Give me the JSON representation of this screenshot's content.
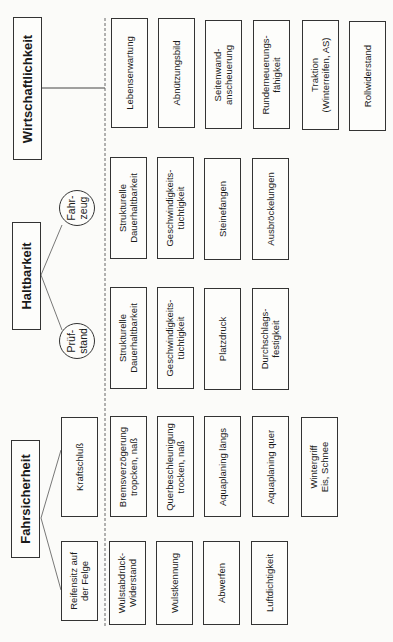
{
  "categories": {
    "wirtschaftlichkeit": {
      "title": "Wirtschaftlichkeit",
      "items": [
        "Lebenserwartung",
        "Abnützungsbild",
        "Seitenwand-\nanscheuerung",
        "Runderneuerungs-\nfähigkeit",
        "Traktion\n(Winterreifen, AS)",
        "Rollwiderstand"
      ]
    },
    "haltbarkeit": {
      "title": "Haltbarkeit",
      "branches": [
        {
          "label": "Fahr-\nzeug",
          "items": [
            "Strukturelle\nDauerhaltbarkeit",
            "Geschwindigkeits-\ntüchtigkeit",
            "Steinefangen",
            "Ausbröckelungen"
          ]
        },
        {
          "label": "Prüf-\nstand",
          "items": [
            "Strukturelle\nDauerhaltbarkeit",
            "Geschwindigkeits-\ntüchtigkeit",
            "Platzdruck",
            "Durchschlags-\nfestigkeit"
          ]
        }
      ]
    },
    "fahrsicherheit": {
      "title": "Fahrsicherheit",
      "branches": [
        {
          "label": "Kraftschluß",
          "items": [
            "Bremsverzögerung\ntropcken, naß",
            "Querbeschleunigung\ntrocken, naß",
            "Aquaplaning längs",
            "Aquaplaning quer",
            "Wintergriff\nEis, Schnee"
          ]
        },
        {
          "label": "Reifensitz auf\nder Felge",
          "items": [
            "Wulstabdrück-\nWiderstand",
            "Wulstkennung",
            "Abwerfen",
            "Luftdichtigkeit"
          ]
        }
      ]
    }
  },
  "colors": {
    "line": "#333333",
    "background": "#fbfbf9"
  }
}
